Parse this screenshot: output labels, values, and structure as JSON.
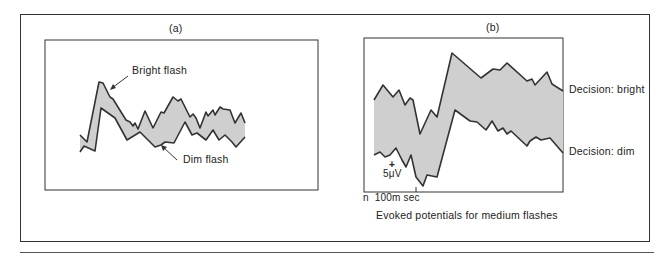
{
  "figure": {
    "panel_a": {
      "label": "(a)",
      "annotations": {
        "upper": "Bright flash",
        "lower": "Dim flash"
      }
    },
    "panel_b": {
      "label": "(b)",
      "annotations": {
        "upper": "Decision: bright",
        "lower": "Decision: dim"
      },
      "scale_bar": {
        "voltage": "5μV",
        "plus": "+",
        "time": "n  100m sec"
      },
      "caption": "Evoked potentials for medium flashes"
    }
  },
  "colors": {
    "fill": "#cfcfcf",
    "line": "#333333",
    "frame": "#333333"
  }
}
